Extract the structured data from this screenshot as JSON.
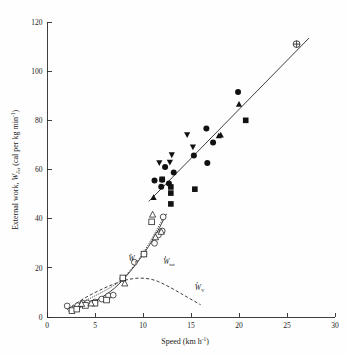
{
  "figure": {
    "width": 347,
    "height": 355,
    "background": "#ffffff",
    "ink_color": "#1a1a1a"
  },
  "chart_data": {
    "type": "scatter",
    "title": "",
    "xlabel": "Speed (km h",
    "xlabel_sup": "-1",
    "xlabel_tail": ")",
    "ylabel_main": "External work, ",
    "ylabel_symbol": "W",
    "ylabel_sub": "ext",
    "ylabel_units": " (cal per kg min",
    "ylabel_units_sup": "-1",
    "ylabel_units_tail": ")",
    "xlim": [
      0,
      30
    ],
    "ylim": [
      0,
      120
    ],
    "xticks": [
      0,
      5,
      10,
      15,
      20,
      25,
      30
    ],
    "xtick_labels": [
      "0",
      "5",
      "10",
      "15",
      "20",
      "25",
      "30"
    ],
    "yticks": [
      0,
      20,
      40,
      60,
      80,
      100,
      120
    ],
    "ytick_labels": [
      "0",
      "20",
      "40",
      "60",
      "80",
      "100",
      "120"
    ],
    "grid": false,
    "legend_position": "none",
    "series": [
      {
        "name": "running-filled-circle",
        "marker": "filled-circle",
        "points": [
          [
            11.2,
            55.5
          ],
          [
            11.9,
            53.0
          ],
          [
            12.0,
            55.8
          ],
          [
            12.3,
            61.0
          ],
          [
            13.2,
            58.8
          ],
          [
            15.3,
            65.7
          ],
          [
            16.6,
            76.7
          ],
          [
            16.7,
            62.6
          ],
          [
            17.3,
            71.0
          ],
          [
            19.9,
            91.5
          ],
          [
            12.7,
            54.3
          ]
        ]
      },
      {
        "name": "running-filled-square",
        "marker": "filled-square",
        "points": [
          [
            12.0,
            56.0
          ],
          [
            12.9,
            52.9
          ],
          [
            12.9,
            50.4
          ],
          [
            12.9,
            46.0
          ],
          [
            15.4,
            52.0
          ],
          [
            20.7,
            80.0
          ]
        ]
      },
      {
        "name": "running-filled-triangle-up",
        "marker": "filled-triangle-up",
        "points": [
          [
            11.1,
            48.6
          ],
          [
            17.9,
            73.7
          ],
          [
            18.1,
            74.0
          ],
          [
            20.0,
            86.5
          ]
        ]
      },
      {
        "name": "running-filled-triangle-down",
        "marker": "filled-triangle-down",
        "points": [
          [
            11.7,
            62.8
          ],
          [
            12.8,
            63.0
          ],
          [
            14.6,
            74.2
          ],
          [
            15.2,
            69.2
          ],
          [
            13.0,
            66.0
          ]
        ]
      },
      {
        "name": "top-crossed-circle",
        "marker": "crossed-circle",
        "points": [
          [
            26.0,
            111.0
          ]
        ]
      },
      {
        "name": "walking-open-circle",
        "marker": "open-circle",
        "points": [
          [
            2.1,
            4.5
          ],
          [
            3.2,
            4.6
          ],
          [
            3.7,
            5.6
          ],
          [
            4.2,
            5.7
          ],
          [
            5.0,
            6.1
          ],
          [
            5.7,
            7.3
          ],
          [
            6.4,
            8.6
          ],
          [
            6.9,
            8.9
          ],
          [
            7.9,
            15.6
          ],
          [
            9.1,
            22.3
          ],
          [
            10.1,
            25.6
          ],
          [
            11.2,
            30.0
          ],
          [
            11.6,
            33.4
          ],
          [
            12.0,
            35.0
          ],
          [
            12.1,
            40.7
          ]
        ]
      },
      {
        "name": "walking-open-square",
        "marker": "open-square",
        "points": [
          [
            2.6,
            2.6
          ],
          [
            3.1,
            3.2
          ],
          [
            4.0,
            4.7
          ],
          [
            5.0,
            5.6
          ],
          [
            6.2,
            6.9
          ],
          [
            7.9,
            15.9
          ],
          [
            10.1,
            25.6
          ],
          [
            10.9,
            38.7
          ]
        ]
      },
      {
        "name": "walking-open-triangle",
        "marker": "open-triangle-up",
        "points": [
          [
            3.6,
            5.3
          ],
          [
            4.6,
            5.5
          ],
          [
            8.1,
            13.6
          ],
          [
            11.3,
            32.4
          ],
          [
            11.9,
            34.6
          ],
          [
            11.0,
            41.6
          ]
        ]
      }
    ],
    "curves": [
      {
        "name": "W-tot-solid",
        "label": "W",
        "label_sub": "tot",
        "style": "solid",
        "label_x": 12.1,
        "label_y": 21.5
      },
      {
        "name": "W-F-dotted",
        "label": "W",
        "label_sub": "F",
        "style": "dotted",
        "label_x": 8.5,
        "label_y": 22.6
      },
      {
        "name": "W-V-dashed",
        "label": "W",
        "label_sub": "V",
        "style": "dashed",
        "label_x": 15.4,
        "label_y": 11.0
      },
      {
        "name": "regression-line",
        "label": "",
        "label_sub": "",
        "style": "solid",
        "label_x": 0,
        "label_y": 0
      }
    ]
  }
}
